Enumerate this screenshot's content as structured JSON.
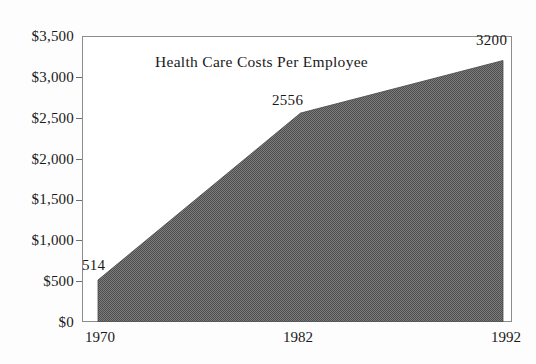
{
  "chart_data": {
    "type": "area",
    "title": "Health Care Costs Per Employee",
    "xlabel": "",
    "ylabel": "",
    "x": [
      "1970",
      "1982",
      "1992"
    ],
    "categories": [
      "1970",
      "1982",
      "1992"
    ],
    "values": [
      514,
      2556,
      3200
    ],
    "point_labels": [
      "514",
      "2556",
      "3200"
    ],
    "series": [
      {
        "name": "Health Care Costs Per Employee",
        "values": [
          514,
          2556,
          3200
        ]
      }
    ],
    "ylim": [
      0,
      3500
    ],
    "ytick_values": [
      0,
      500,
      1000,
      1500,
      2000,
      2500,
      3000,
      3500
    ],
    "ytick_labels": [
      "$0",
      "$500",
      "$1,000",
      "$1,500",
      "$2,000",
      "$2,500",
      "$3,000",
      "$3,500"
    ],
    "xtick_labels": [
      "1970",
      "1982",
      "1992"
    ],
    "grid": false,
    "legend": false,
    "legend_position": "none",
    "colors": {
      "fill": "#6a6a6a",
      "axis": "#8c8c8c",
      "text": "#1a1a1a",
      "background": "#fdfdfd",
      "plot_background": "#ffffff"
    }
  }
}
